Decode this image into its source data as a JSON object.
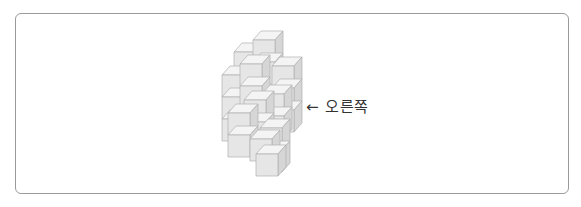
{
  "figure": {
    "annotation": {
      "arrow": "←",
      "text": "오른쪽"
    },
    "colors": {
      "border": "#9a9a9a",
      "cube_top": "#f4f4f4",
      "cube_front": "#e6e6e6",
      "cube_side": "#d6d6d6",
      "cube_edge": "#b0b0b0",
      "text": "#333333"
    }
  }
}
